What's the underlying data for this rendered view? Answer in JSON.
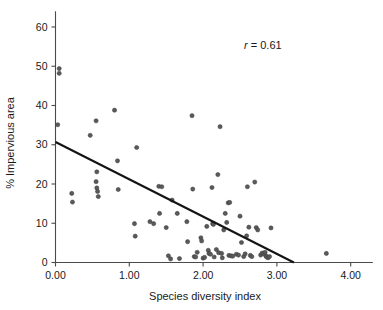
{
  "chart_data": {
    "type": "scatter",
    "title": "",
    "xlabel": "Species diversity index",
    "ylabel": "% Impervious area",
    "xlim": [
      0.0,
      4.3
    ],
    "ylim": [
      0,
      64
    ],
    "xticks": [
      "0.00",
      "1.00",
      "2.00",
      "3.00",
      "4.00"
    ],
    "xtick_values": [
      0.0,
      1.0,
      2.0,
      3.0,
      4.0
    ],
    "yticks": [
      "0",
      "10",
      "20",
      "30",
      "40",
      "50",
      "60"
    ],
    "ytick_values": [
      0,
      10,
      20,
      30,
      40,
      50,
      60
    ],
    "grid": false,
    "legend": false,
    "annotations": [
      {
        "name": "correlation",
        "symbol": "r",
        "equals": "=",
        "value": "0.61",
        "text": "r = 0.61",
        "x": 2.55,
        "y": 55.5
      }
    ],
    "trendline": {
      "name": "linear-fit",
      "x_start": 0.0,
      "y_start": 30.7,
      "x_end": 3.23,
      "y_end": 0.0
    },
    "series": [
      {
        "name": "sites",
        "marker": "circle",
        "color": "#5a5a5a",
        "points": [
          [
            0.05,
            49.4
          ],
          [
            0.05,
            48.2
          ],
          [
            0.03,
            35.1
          ],
          [
            0.22,
            17.6
          ],
          [
            0.23,
            15.4
          ],
          [
            0.47,
            32.4
          ],
          [
            0.55,
            36.1
          ],
          [
            0.56,
            23.1
          ],
          [
            0.55,
            20.6
          ],
          [
            0.56,
            19.0
          ],
          [
            0.57,
            18.1
          ],
          [
            0.58,
            16.8
          ],
          [
            0.8,
            38.8
          ],
          [
            0.84,
            25.9
          ],
          [
            0.85,
            18.6
          ],
          [
            1.07,
            9.9
          ],
          [
            1.08,
            6.7
          ],
          [
            1.1,
            29.3
          ],
          [
            1.28,
            10.4
          ],
          [
            1.33,
            9.9
          ],
          [
            1.4,
            19.4
          ],
          [
            1.44,
            19.3
          ],
          [
            1.41,
            12.5
          ],
          [
            1.5,
            8.9
          ],
          [
            1.53,
            1.7
          ],
          [
            1.56,
            0.9
          ],
          [
            1.58,
            15.9
          ],
          [
            1.65,
            12.5
          ],
          [
            1.68,
            1.0
          ],
          [
            1.78,
            10.4
          ],
          [
            1.79,
            5.3
          ],
          [
            1.85,
            37.4
          ],
          [
            1.86,
            18.7
          ],
          [
            1.88,
            1.5
          ],
          [
            1.9,
            1.4
          ],
          [
            1.92,
            2.6
          ],
          [
            1.97,
            6.3
          ],
          [
            1.98,
            5.5
          ],
          [
            2.0,
            1.1
          ],
          [
            2.02,
            1.3
          ],
          [
            2.05,
            9.2
          ],
          [
            2.07,
            3.1
          ],
          [
            2.08,
            2.3
          ],
          [
            2.1,
            2.1
          ],
          [
            2.12,
            19.1
          ],
          [
            2.13,
            9.9
          ],
          [
            2.14,
            9.7
          ],
          [
            2.15,
            1.4
          ],
          [
            2.18,
            3.3
          ],
          [
            2.2,
            22.4
          ],
          [
            2.21,
            2.5
          ],
          [
            2.23,
            34.6
          ],
          [
            2.25,
            2.3
          ],
          [
            2.26,
            1.2
          ],
          [
            2.28,
            8.3
          ],
          [
            2.3,
            12.5
          ],
          [
            2.32,
            10.2
          ],
          [
            2.34,
            15.2
          ],
          [
            2.36,
            15.3
          ],
          [
            2.35,
            1.8
          ],
          [
            2.38,
            1.7
          ],
          [
            2.4,
            1.6
          ],
          [
            2.45,
            2.1
          ],
          [
            2.48,
            1.9
          ],
          [
            2.5,
            11.8
          ],
          [
            2.52,
            5.1
          ],
          [
            2.55,
            1.5
          ],
          [
            2.57,
            2.2
          ],
          [
            2.59,
            6.8
          ],
          [
            2.6,
            19.3
          ],
          [
            2.62,
            9.0
          ],
          [
            2.64,
            1.8
          ],
          [
            2.66,
            1.5
          ],
          [
            2.7,
            20.5
          ],
          [
            2.72,
            8.9
          ],
          [
            2.74,
            8.3
          ],
          [
            2.78,
            1.9
          ],
          [
            2.8,
            2.4
          ],
          [
            2.82,
            2.2
          ],
          [
            2.84,
            2.6
          ],
          [
            2.85,
            1.7
          ],
          [
            2.86,
            1.4
          ],
          [
            2.88,
            1.2
          ],
          [
            2.9,
            1.5
          ],
          [
            2.92,
            8.8
          ],
          [
            3.67,
            2.3
          ]
        ]
      }
    ]
  },
  "figure": {
    "caption": ""
  }
}
